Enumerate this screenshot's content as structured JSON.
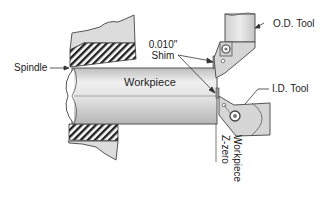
{
  "diagram": {
    "type": "technical-illustration",
    "labels": {
      "spindle": "Spindle",
      "workpiece": "Workpiece",
      "shim_value": "0.010\"",
      "shim": "Shim",
      "od_tool": "O.D. Tool",
      "id_tool": "I.D. Tool",
      "z_zero_line1": "Workpiece",
      "z_zero_line2": "Z-zero"
    },
    "colors": {
      "outline": "#555555",
      "spindle_fill": "#dcdcdc",
      "hatch": "#222222",
      "workpiece_light": "#f2f2f2",
      "workpiece_dark": "#bdbdbd",
      "tool_fill": "#d0d0d0",
      "text": "#222222"
    }
  }
}
